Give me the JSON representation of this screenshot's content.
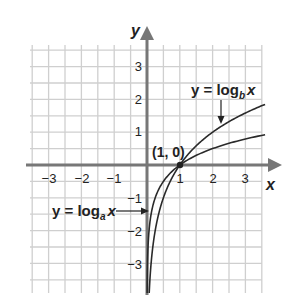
{
  "chart_data": {
    "type": "line",
    "title": "",
    "xlabel": "x",
    "ylabel": "y",
    "xlim": [
      -3.5,
      3.5
    ],
    "ylim": [
      -3.9,
      3.6
    ],
    "grid": true,
    "grid_step": 0.5,
    "x_ticks": [
      -3,
      -2,
      -1,
      1,
      2,
      3
    ],
    "x_tick_labels": [
      "−3",
      "−2",
      "−1",
      "1",
      "2",
      "3"
    ],
    "y_ticks": [
      3,
      2,
      1,
      -1,
      -2,
      -3
    ],
    "y_tick_labels": [
      "3",
      "2",
      "1",
      "−1",
      "−2",
      "−3"
    ],
    "series": [
      {
        "name": "y = log_b x",
        "base": 2,
        "x": [
          0.088,
          0.125,
          0.25,
          0.5,
          1,
          1.5,
          2,
          2.5,
          3,
          3.5
        ],
        "y": [
          -3.5,
          -3,
          -2,
          -1,
          0,
          0.58,
          1,
          1.32,
          1.58,
          1.81
        ]
      },
      {
        "name": "y = log_a x",
        "base": 4,
        "x": [
          0.008,
          0.016,
          0.0625,
          0.25,
          0.5,
          1,
          2,
          3,
          3.5
        ],
        "y": [
          -3.5,
          -3,
          -2,
          -1,
          -0.5,
          0,
          0.5,
          0.79,
          0.9
        ]
      }
    ],
    "annotations": [
      {
        "text": "(1, 0)",
        "x": 1,
        "y": 0,
        "type": "point-label"
      },
      {
        "text": "y = log_b x",
        "target_series": 0,
        "type": "arrow-label"
      },
      {
        "text": "y = log_a x",
        "target_series": 1,
        "type": "arrow-label"
      }
    ]
  },
  "labels": {
    "x_axis": "x",
    "y_axis": "y",
    "point": "(1, 0)",
    "logb_prefix": "y = log",
    "logb_sub": "b",
    "logb_suffix": "x",
    "loga_prefix": "y = log",
    "loga_sub": "a",
    "loga_suffix": "x",
    "x_ticks": [
      "−3",
      "−2",
      "−1",
      "1",
      "2",
      "3"
    ],
    "y_ticks": [
      "3",
      "2",
      "1",
      "−1",
      "−2",
      "−3"
    ]
  },
  "colors": {
    "grid": "#cfcfcf",
    "axis": "#777777",
    "curve": "#2a2a2a",
    "text": "#222222"
  }
}
